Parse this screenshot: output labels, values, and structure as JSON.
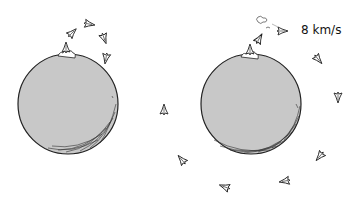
{
  "illustration": {
    "description": "Two planets: left shows rockets launched slowly falling back in an arc; right shows a rocket launched at orbital speed circling the planet",
    "planet_color": "#c8c8c8",
    "outline_color": "#222222",
    "left_panel": {
      "planet": {
        "cx": 68,
        "cy": 104,
        "r": 50
      },
      "rockets": [
        {
          "x": 72,
          "y": 33,
          "angle": 45
        },
        {
          "x": 89,
          "y": 24,
          "angle": 100
        },
        {
          "x": 104,
          "y": 38,
          "angle": 160
        },
        {
          "x": 106,
          "y": 58,
          "angle": 190
        }
      ]
    },
    "right_panel": {
      "planet": {
        "cx": 251,
        "cy": 104,
        "r": 50
      },
      "speed_label": "8 km/s",
      "rockets": [
        {
          "x": 259,
          "y": 39,
          "angle": 30
        },
        {
          "x": 282,
          "y": 31,
          "angle": 90
        },
        {
          "x": 318,
          "y": 59,
          "angle": 140
        },
        {
          "x": 338,
          "y": 97,
          "angle": 180
        },
        {
          "x": 320,
          "y": 156,
          "angle": 220
        },
        {
          "x": 285,
          "y": 181,
          "angle": 260
        },
        {
          "x": 225,
          "y": 187,
          "angle": 290
        },
        {
          "x": 182,
          "y": 160,
          "angle": 320
        },
        {
          "x": 164,
          "y": 110,
          "angle": 0
        }
      ]
    }
  }
}
